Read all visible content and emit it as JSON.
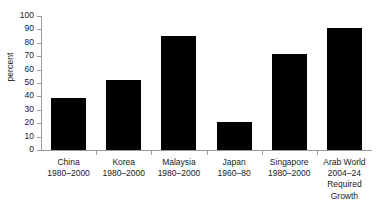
{
  "chart_data": {
    "type": "bar",
    "title": "",
    "xlabel": "",
    "ylabel": "percent",
    "ylim": [
      0,
      100
    ],
    "ytick_step": 10,
    "grid": false,
    "legend": null,
    "bar_color": "#000000",
    "axis_color": "#9a9a9a",
    "categories": [
      "China\n1980–2000",
      "Korea\n1980–2000",
      "Malaysia\n1980–2000",
      "Japan\n1960–80",
      "Singapore\n1980–2000",
      "Arab World\n2004–24\nRequired\nGrowth"
    ],
    "category_names": [
      "China",
      "Korea",
      "Malaysia",
      "Japan",
      "Singapore",
      "Arab World"
    ],
    "category_periods": [
      "1980–2000",
      "1980–2000",
      "1980–2000",
      "1960–80",
      "1980–2000",
      "2004–24 Required Growth"
    ],
    "values": [
      39,
      52,
      85,
      21,
      72,
      91
    ],
    "yticks": [
      0,
      10,
      20,
      30,
      40,
      50,
      60,
      70,
      80,
      90,
      100
    ],
    "ytick_labels": [
      "0",
      "10",
      "20",
      "30",
      "40",
      "50",
      "60",
      "70",
      "80",
      "90",
      "100"
    ]
  }
}
